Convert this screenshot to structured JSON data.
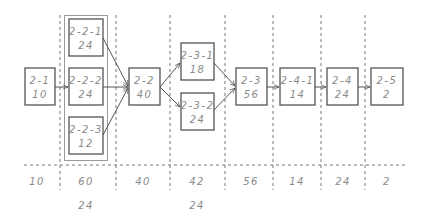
{
  "diagram": {
    "type": "process-flow",
    "colors": {
      "line": "#555555",
      "text": "#8a8a8a",
      "dash": "#777777",
      "container": "#9a9a9a"
    },
    "nodes": [
      {
        "id": "2-1",
        "value": "10"
      },
      {
        "id": "2-2-1",
        "value": "24"
      },
      {
        "id": "2-2-2",
        "value": "24"
      },
      {
        "id": "2-2-3",
        "value": "12"
      },
      {
        "id": "2-2",
        "value": "40"
      },
      {
        "id": "2-3-1",
        "value": "18"
      },
      {
        "id": "2-3-2",
        "value": "24"
      },
      {
        "id": "2-3",
        "value": "56"
      },
      {
        "id": "2-4-1",
        "value": "14"
      },
      {
        "id": "2-4",
        "value": "24"
      },
      {
        "id": "2-5",
        "value": "2"
      }
    ],
    "edges": [
      [
        "2-1",
        "2-2-2"
      ],
      [
        "2-2-1",
        "2-2"
      ],
      [
        "2-2-2",
        "2-2"
      ],
      [
        "2-2-3",
        "2-2"
      ],
      [
        "2-2",
        "2-3-1"
      ],
      [
        "2-2",
        "2-3-2"
      ],
      [
        "2-3-1",
        "2-3"
      ],
      [
        "2-3-2",
        "2-3"
      ],
      [
        "2-3",
        "2-4-1"
      ],
      [
        "2-4-1",
        "2-4"
      ],
      [
        "2-4",
        "2-5"
      ]
    ],
    "totals_row": [
      "10",
      "60",
      "40",
      "42",
      "56",
      "14",
      "24",
      "2"
    ],
    "secondary_row": {
      "col2": "24",
      "col4": "24"
    }
  }
}
